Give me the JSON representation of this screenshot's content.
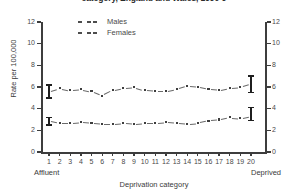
{
  "chart_data": {
    "type": "line",
    "title": "category, England and Wales, 1990-9",
    "xlabel": "Deprivation category",
    "ylabel": "Rate per 100,000",
    "xlim": [
      1,
      20
    ],
    "ylim": [
      0,
      12
    ],
    "ytick_labels": [
      "0",
      "2",
      "4",
      "6",
      "8",
      "10",
      "12"
    ],
    "yticks": [
      0,
      2,
      4,
      6,
      8,
      10,
      12
    ],
    "categories": [
      1,
      2,
      3,
      4,
      5,
      6,
      7,
      8,
      9,
      10,
      11,
      12,
      13,
      14,
      15,
      16,
      17,
      18,
      19,
      20
    ],
    "xtick_labels": [
      "1",
      "2",
      "3",
      "4",
      "5",
      "6",
      "7",
      "8",
      "9",
      "10",
      "11",
      "12",
      "13",
      "14",
      "15",
      "16",
      "17",
      "18",
      "19",
      "20"
    ],
    "x_left_annotation": "Affluent",
    "x_right_annotation": "Deprived",
    "grid": false,
    "legend_position": "top-left",
    "marker": "dotted-dashed",
    "series": [
      {
        "name": "Males",
        "values": [
          5.6,
          5.9,
          5.7,
          5.8,
          5.6,
          5.2,
          5.7,
          5.9,
          6.0,
          5.7,
          5.6,
          5.6,
          5.8,
          6.1,
          6.0,
          5.8,
          5.7,
          5.9,
          6.0,
          6.3
        ],
        "error_bars": [
          {
            "category": 1,
            "low": 5.0,
            "high": 6.2
          },
          {
            "category": 20,
            "low": 5.5,
            "high": 7.0
          }
        ]
      },
      {
        "name": "Females",
        "values": [
          2.9,
          2.7,
          2.7,
          2.8,
          2.7,
          2.6,
          2.6,
          2.7,
          2.6,
          2.7,
          2.7,
          2.8,
          2.7,
          2.6,
          2.7,
          2.9,
          3.0,
          3.2,
          3.1,
          3.3
        ],
        "error_bars": [
          {
            "category": 1,
            "low": 2.5,
            "high": 3.2
          },
          {
            "category": 20,
            "low": 2.9,
            "high": 4.1
          }
        ]
      }
    ]
  },
  "legend": {
    "items": [
      {
        "label": "Males"
      },
      {
        "label": "Females"
      }
    ]
  }
}
